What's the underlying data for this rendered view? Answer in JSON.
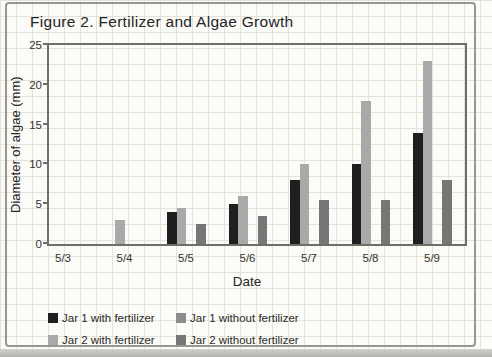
{
  "chart_data": {
    "type": "bar",
    "title": "Figure 2. Fertilizer and Algae Growth",
    "xlabel": "Date",
    "ylabel": "Diameter of algae (mm)",
    "ylim": [
      0,
      25
    ],
    "yticks": [
      0,
      5,
      10,
      15,
      20,
      25
    ],
    "grid": "graph-paper background, no plot gridlines",
    "legend_position": "bottom-left, two columns",
    "categories": [
      "5/3",
      "5/4",
      "5/5",
      "5/6",
      "5/7",
      "5/8",
      "5/9"
    ],
    "series": [
      {
        "name": "Jar 1 with fertilizer",
        "color": "#1f1f1f",
        "values": [
          0,
          0,
          4,
          5,
          8,
          10,
          14
        ]
      },
      {
        "name": "Jar 2 with fertilizer",
        "color": "#a9a9a9",
        "values": [
          0,
          3,
          4.5,
          6,
          10,
          18,
          23
        ]
      },
      {
        "name": "Jar 1 without fertilizer",
        "color": "#8c8c8c",
        "values": [
          0,
          0,
          0,
          0,
          0,
          0,
          0
        ]
      },
      {
        "name": "Jar 2 without fertilizer",
        "color": "#767676",
        "values": [
          0,
          0,
          2.5,
          3.5,
          5.5,
          5.5,
          8
        ]
      }
    ],
    "colors": {
      "frame": "#6f6f68",
      "card_border": "#97978f",
      "paper_grid": "#e3e3dc",
      "text": "#262626"
    }
  }
}
